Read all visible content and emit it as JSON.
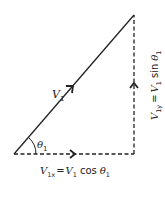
{
  "diagram": {
    "vector_label": "V",
    "vector_sub": "1",
    "angle_label": "θ",
    "angle_sub": "1",
    "x_component": {
      "lhs": "V",
      "lhs_sub": "1x",
      "eq": "=",
      "rhs": "V",
      "rhs_sub": "1",
      "func": "cos",
      "arg": "θ",
      "arg_sub": "1"
    },
    "y_component": {
      "lhs": "V",
      "lhs_sub": "1y",
      "eq": "=",
      "rhs": "V",
      "rhs_sub": "1",
      "func": "sin",
      "arg": "θ",
      "arg_sub": "1"
    },
    "colors": {
      "line": "#222222",
      "background": "#ffffff"
    }
  }
}
